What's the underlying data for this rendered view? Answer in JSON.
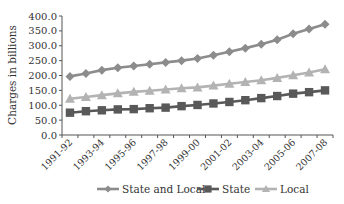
{
  "chart_data": {
    "type": "line",
    "title": "",
    "xlabel": "",
    "ylabel": "Charges in billions",
    "ylim": [
      0,
      400
    ],
    "yticks": [
      "0.0",
      "50.0",
      "100.0",
      "150.0",
      "200.0",
      "250.0",
      "300.0",
      "350.0",
      "400.0"
    ],
    "x": [
      "1991-92",
      "1992-93",
      "1993-94",
      "1994-95",
      "1995-96",
      "1996-97",
      "1997-98",
      "1998-99",
      "1999-00",
      "2000-01",
      "2001-02",
      "2002-03",
      "2003-04",
      "2004-05",
      "2005-06",
      "2006-07",
      "2007-08"
    ],
    "xtick_labels": [
      "1991-92",
      "1993-94",
      "1995-96",
      "1997-98",
      "1999-00",
      "2001-02",
      "2003-04",
      "2005-06",
      "2007-08"
    ],
    "grid": false,
    "legend_position": "bottom",
    "series": [
      {
        "name": "State and Local",
        "marker": "diamond",
        "color": "#8c8c8c",
        "values": [
          197,
          207,
          218,
          226,
          232,
          238,
          244,
          250,
          257,
          268,
          280,
          292,
          305,
          320,
          340,
          356,
          372
        ]
      },
      {
        "name": "State",
        "marker": "square",
        "color": "#595959",
        "values": [
          75,
          80,
          83,
          86,
          87,
          90,
          92,
          97,
          101,
          106,
          111,
          117,
          124,
          131,
          139,
          144,
          150
        ]
      },
      {
        "name": "Local",
        "marker": "triangle",
        "color": "#b3b3b3",
        "values": [
          122,
          128,
          134,
          140,
          145,
          149,
          153,
          157,
          160,
          166,
          172,
          178,
          184,
          192,
          201,
          210,
          221
        ]
      }
    ]
  },
  "legend": {
    "items": [
      {
        "label": "State and Local"
      },
      {
        "label": "State"
      },
      {
        "label": "Local"
      }
    ]
  },
  "axis": {
    "ylabel": "Charges in billions"
  }
}
